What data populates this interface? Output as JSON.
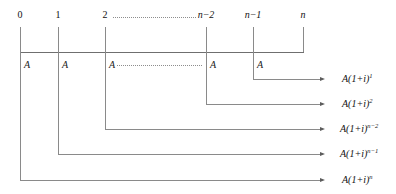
{
  "diagram": {
    "line_color": "#8a8a8a",
    "text_color": "#111111",
    "ticks": [
      {
        "id": "t0",
        "label": "0",
        "x": 20
      },
      {
        "id": "t1",
        "label": "1",
        "x": 58
      },
      {
        "id": "t2",
        "label": "2",
        "x": 105
      },
      {
        "id": "tn2",
        "label": "n−2",
        "x": 206
      },
      {
        "id": "tn1",
        "label": "n−1",
        "x": 253
      },
      {
        "id": "tn",
        "label": "n",
        "x": 303
      }
    ],
    "payments": [
      {
        "id": "a0",
        "label": "A",
        "x": 24
      },
      {
        "id": "a1",
        "label": "A",
        "x": 62
      },
      {
        "id": "a2",
        "label": "A",
        "x": 109
      },
      {
        "id": "an2",
        "label": "A",
        "x": 210
      },
      {
        "id": "an1",
        "label": "A",
        "x": 257
      }
    ],
    "ellipsis_top": {
      "from_x": 113,
      "to_x": 196,
      "y": 17
    },
    "ellipsis_mid": {
      "from_x": 117,
      "to_x": 202,
      "y": 65
    },
    "axis": {
      "y": 52,
      "x_start": 20,
      "x_end": 303
    },
    "arrow_tip_x": 322,
    "results": [
      {
        "id": "r1",
        "base": "A(1+i)",
        "exponent": "1",
        "y": 79,
        "origin_x": 253,
        "label_x": 342
      },
      {
        "id": "r2",
        "base": "A(1+i)",
        "exponent": "2",
        "y": 104,
        "origin_x": 206,
        "label_x": 342
      },
      {
        "id": "r3",
        "base": "A(1+i)",
        "exponent": "n−2",
        "y": 129,
        "origin_x": 105,
        "label_x": 340
      },
      {
        "id": "r4",
        "base": "A(1+i)",
        "exponent": "n−1",
        "y": 154,
        "origin_x": 58,
        "label_x": 340
      },
      {
        "id": "r5",
        "base": "A(1+i)",
        "exponent": "n",
        "y": 180,
        "origin_x": 20,
        "label_x": 342
      }
    ]
  }
}
